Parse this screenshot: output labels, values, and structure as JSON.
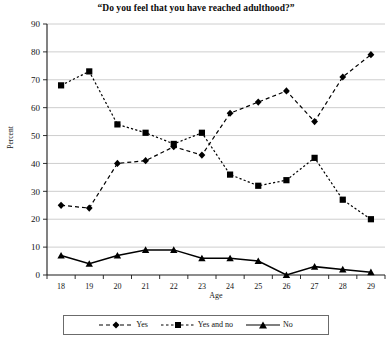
{
  "chart_data": {
    "type": "line",
    "title": "“Do you feel that you have reached adulthood?”",
    "xlabel": "Age",
    "ylabel": "Percent",
    "categories": [
      18,
      19,
      20,
      21,
      22,
      23,
      24,
      25,
      26,
      27,
      28,
      29
    ],
    "xtick_labels": [
      "18",
      "19",
      "20",
      "21",
      "22",
      "23",
      "24",
      "25",
      "26",
      "27",
      "28",
      "29"
    ],
    "ytick_labels": [
      "0",
      "10",
      "20",
      "30",
      "40",
      "50",
      "60",
      "70",
      "80",
      "90"
    ],
    "yticks": [
      0,
      10,
      20,
      30,
      40,
      50,
      60,
      70,
      80,
      90
    ],
    "ylim": [
      0,
      90
    ],
    "grid": true,
    "grid_axis": "y",
    "legend_position": "bottom",
    "series": [
      {
        "name": "Yes",
        "marker": "diamond",
        "linestyle": "dashed",
        "color": "#000000",
        "values": [
          25,
          24,
          40,
          41,
          46,
          43,
          58,
          62,
          66,
          55,
          71,
          79
        ]
      },
      {
        "name": "Yes and no",
        "marker": "square",
        "linestyle": "dashed",
        "color": "#000000",
        "values": [
          68,
          73,
          54,
          51,
          47,
          51,
          36,
          32,
          34,
          42,
          27,
          20
        ]
      },
      {
        "name": "No",
        "marker": "triangle",
        "linestyle": "solid",
        "color": "#000000",
        "values": [
          7,
          4,
          7,
          9,
          9,
          6,
          6,
          5,
          0,
          3,
          2,
          1
        ]
      }
    ]
  },
  "legend": {
    "items": [
      {
        "label": "Yes",
        "marker": "diamond",
        "linestyle": "dashed"
      },
      {
        "label": "Yes and no",
        "marker": "square",
        "linestyle": "dashed"
      },
      {
        "label": "No",
        "marker": "triangle",
        "linestyle": "solid"
      }
    ]
  },
  "colors": {
    "ink": "#000000",
    "grid": "#c8c8c8",
    "axis": "#1a1a1a",
    "background": "#ffffff"
  }
}
